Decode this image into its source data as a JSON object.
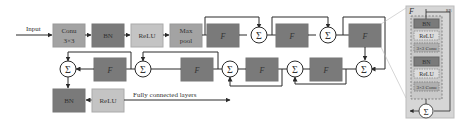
{
  "colors": {
    "dark": "#7a7a7a",
    "medium": "#a3a3a3",
    "light": "#c4c4c4",
    "line": "#2a2a2a",
    "panel": "#d6d6d6",
    "inner": "#c9c9c9"
  },
  "input_label": "Input",
  "output_label": "Fully connected layers",
  "row1": {
    "conv": [
      "Conu",
      "3×3"
    ],
    "bn": "BN",
    "relu": "ReLU",
    "maxpool": [
      "Max",
      "pool"
    ],
    "blocks": [
      "F",
      "F",
      "F"
    ],
    "sums": [
      "Σ",
      "Σ"
    ]
  },
  "row2": {
    "blocks": [
      "F",
      "F",
      "F"
    ],
    "sums": [
      "Σ",
      "Σ",
      "Σ",
      "Σ"
    ]
  },
  "row3": {
    "bn": "BN",
    "relu": "ReLU"
  },
  "detail": {
    "title": "F",
    "tag": "RB",
    "layers": [
      "BN",
      "ReLU",
      "3×3 Conu",
      "BN",
      "ReLU",
      "3×3 Conu"
    ],
    "sum": "Σ"
  }
}
